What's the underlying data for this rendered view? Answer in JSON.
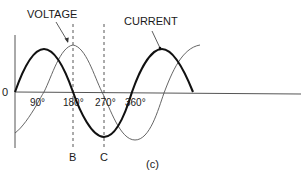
{
  "figure": {
    "panel_label": "(c)",
    "origin_label": "0",
    "curves": [
      {
        "name": "VOLTAGE",
        "style": "thin",
        "phase": "lags current by 90°"
      },
      {
        "name": "CURRENT",
        "style": "bold",
        "phase": "starts at 0°"
      }
    ],
    "labels": {
      "voltage": "VOLTAGE",
      "current": "CURRENT"
    },
    "x_ticks": [
      "90°",
      "180°",
      "270°",
      "360°"
    ],
    "markers": [
      {
        "label": "B",
        "at": "180°"
      },
      {
        "label": "C",
        "at": "270°"
      }
    ],
    "colors": {
      "current": "#111111",
      "voltage": "#555555",
      "axis": "#555555"
    }
  }
}
